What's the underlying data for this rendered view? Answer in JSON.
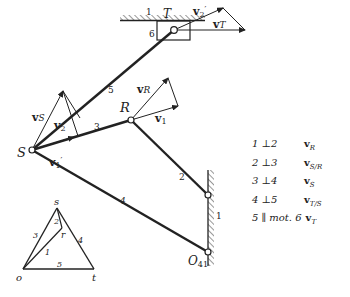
{
  "diagram": {
    "points": {
      "S": "S",
      "R": "R",
      "T": "T",
      "O41": "O",
      "O41_sub": "41"
    },
    "links": {
      "link1_top": "1",
      "link1_wall": "1",
      "link2": "2",
      "link3": "3",
      "link4": "4",
      "link5": "5",
      "link6": "6"
    },
    "vectors": {
      "vS": {
        "main": "v",
        "sub": "S"
      },
      "v2": {
        "main": "v",
        "sub": "2"
      },
      "v1p": {
        "main": "v",
        "sub": "1",
        "prime": "′"
      },
      "vR": {
        "main": "v",
        "sub": "R"
      },
      "v1": {
        "main": "v",
        "sub": "1"
      },
      "v2p": {
        "main": "v",
        "sub": "2",
        "prime": "′"
      },
      "vT": {
        "main": "v",
        "sub": "T"
      }
    },
    "velocity_polygon": {
      "o": "o",
      "s": "s",
      "t": "t",
      "r": "r",
      "e1": "1",
      "e2": "2",
      "e3": "3",
      "e4": "4",
      "e5": "5"
    }
  },
  "legend": [
    {
      "cond": "1 ⊥2",
      "vec": "v",
      "sub": "R"
    },
    {
      "cond": "2 ⊥3",
      "vec": "v",
      "sub": "S/R"
    },
    {
      "cond": "3 ⊥4",
      "vec": "v",
      "sub": "S"
    },
    {
      "cond": "4 ⊥5",
      "vec": "v",
      "sub": "T/S"
    },
    {
      "cond": "5 ∥ mot. 6",
      "vec": "v",
      "sub": "T"
    }
  ]
}
